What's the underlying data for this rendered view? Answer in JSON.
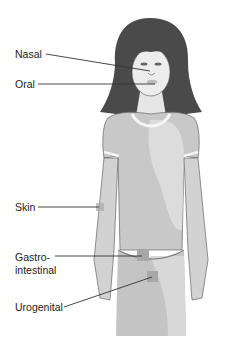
{
  "diagram": {
    "title": "",
    "labels": [
      {
        "id": "nasal",
        "text": "Nasal"
      },
      {
        "id": "oral",
        "text": "Oral"
      },
      {
        "id": "skin",
        "text": "Skin"
      },
      {
        "id": "gastro",
        "text": "Gastro-",
        "text2": "intestinal"
      },
      {
        "id": "urogenital",
        "text": "Urogenital"
      }
    ],
    "colors": {
      "hair": "#4a4a4a",
      "skin_light": "#ededed",
      "shirt": "#c8c8c8",
      "highlight_region": "#dcdcdc",
      "marker": "#a8a8a8",
      "line": "#333333"
    }
  }
}
